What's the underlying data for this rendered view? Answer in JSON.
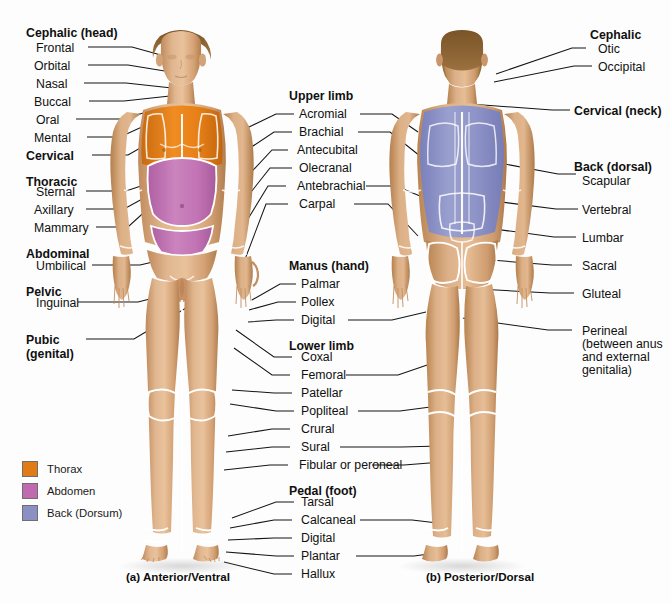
{
  "background": "#fdfdfd",
  "colors": {
    "thorax": "#E07B18",
    "abdomen": "#C06BB0",
    "back_dorsum": "#8A8FC4",
    "skin_light": "#E6BA96",
    "skin_mid": "#D9A579",
    "skin_dark": "#B9824F",
    "hair": "#8A6236",
    "leader": "#141414",
    "outline": "#ffffff"
  },
  "captions": {
    "anterior": "(a) Anterior/Ventral",
    "posterior": "(b) Posterior/Dorsal"
  },
  "legend": {
    "items": [
      {
        "label": "Thorax",
        "color": "#E07B18"
      },
      {
        "label": "Abdomen",
        "color": "#C06BB0"
      },
      {
        "label": "Back (Dorsum)",
        "color": "#8A8FC4"
      }
    ]
  },
  "left_column": {
    "groups": [
      {
        "heading": "Cephalic (head)",
        "items": [
          "Frontal",
          "Orbital",
          "Nasal",
          "Buccal",
          "Oral",
          "Mental"
        ]
      },
      {
        "heading": "Cervical",
        "items": []
      },
      {
        "heading": "Thoracic",
        "items": [
          "Sternal",
          "Axillary",
          "Mammary"
        ]
      },
      {
        "heading": "Abdominal",
        "items": [
          "Umbilical"
        ]
      },
      {
        "heading": "Pelvic",
        "items": [
          "Inguinal"
        ]
      },
      {
        "heading": "Pubic",
        "heading_line2": "(genital)",
        "items": []
      }
    ]
  },
  "center_column": {
    "groups": [
      {
        "heading": "Upper limb",
        "items": [
          "Acromial",
          "Brachial",
          "Antecubital",
          "Olecranal",
          "Antebrachial",
          "Carpal"
        ]
      },
      {
        "heading": "Manus (hand)",
        "items": [
          "Palmar",
          "Pollex",
          "Digital"
        ]
      },
      {
        "heading": "Lower limb",
        "items": [
          "Coxal",
          "Femoral",
          "Patellar",
          "Popliteal",
          "Crural",
          "Sural",
          "Fibular or peroneal"
        ]
      },
      {
        "heading": "Pedal (foot)",
        "items": [
          "Tarsal",
          "Calcaneal",
          "Digital",
          "Plantar",
          "Hallux"
        ]
      }
    ]
  },
  "right_column": {
    "groups": [
      {
        "heading": "Cephalic",
        "items": [
          "Otic",
          "Occipital"
        ]
      },
      {
        "heading": "Cervical (neck)",
        "items": []
      },
      {
        "heading": "Back (dorsal)",
        "items": [
          "Scapular",
          "Vertebral",
          "Lumbar",
          "Sacral",
          "Gluteal"
        ]
      }
    ],
    "perineal": {
      "label": "Perineal",
      "detail": "(between anus and external genitalia)"
    }
  },
  "labels_flat": {
    "l_cephalic": "Cephalic (head)",
    "l_frontal": "Frontal",
    "l_orbital": "Orbital",
    "l_nasal": "Nasal",
    "l_buccal": "Buccal",
    "l_oral": "Oral",
    "l_mental": "Mental",
    "l_cervical": "Cervical",
    "l_thoracic": "Thoracic",
    "l_sternal": "Sternal",
    "l_axillary": "Axillary",
    "l_mammary": "Mammary",
    "l_abdominal": "Abdominal",
    "l_umbilical": "Umbilical",
    "l_pelvic": "Pelvic",
    "l_inguinal": "Inguinal",
    "l_pubic": "Pubic",
    "l_pubic2": "(genital)",
    "c_upper_limb": "Upper limb",
    "c_acromial": "Acromial",
    "c_brachial": "Brachial",
    "c_antecubital": "Antecubital",
    "c_olecranal": "Olecranal",
    "c_antebrachial": "Antebrachial",
    "c_carpal": "Carpal",
    "c_manus": "Manus (hand)",
    "c_palmar": "Palmar",
    "c_pollex": "Pollex",
    "c_digital": "Digital",
    "c_lower_limb": "Lower limb",
    "c_coxal": "Coxal",
    "c_femoral": "Femoral",
    "c_patellar": "Patellar",
    "c_popliteal": "Popliteal",
    "c_crural": "Crural",
    "c_sural": "Sural",
    "c_fibular": "Fibular or peroneal",
    "c_pedal": "Pedal (foot)",
    "c_tarsal": "Tarsal",
    "c_calcaneal": "Calcaneal",
    "c_digital2": "Digital",
    "c_plantar": "Plantar",
    "c_hallux": "Hallux",
    "r_cephalic": "Cephalic",
    "r_otic": "Otic",
    "r_occipital": "Occipital",
    "r_cervical": "Cervical (neck)",
    "r_back": "Back (dorsal)",
    "r_scapular": "Scapular",
    "r_vertebral": "Vertebral",
    "r_lumbar": "Lumbar",
    "r_sacral": "Sacral",
    "r_gluteal": "Gluteal",
    "r_perineal": "Perineal",
    "r_perineal_detail": "(between anus and external genitalia)"
  }
}
